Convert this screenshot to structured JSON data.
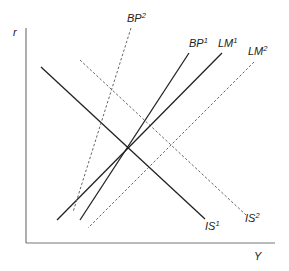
{
  "chart_data": {
    "type": "line",
    "title": "",
    "xlabel": "Y",
    "ylabel": "r",
    "grid": false,
    "lines": [
      {
        "name": "IS1",
        "label": "IS",
        "sup": "1",
        "style": "solid",
        "x1": 41,
        "y1": 67,
        "x2": 205,
        "y2": 219
      },
      {
        "name": "IS2",
        "label": "IS",
        "sup": "2",
        "style": "dashed",
        "x1": 80,
        "y1": 60,
        "x2": 246,
        "y2": 215
      },
      {
        "name": "LM1",
        "label": "LM",
        "sup": "1",
        "style": "solid",
        "x1": 222,
        "y1": 53,
        "x2": 57,
        "y2": 220
      },
      {
        "name": "LM2",
        "label": "LM",
        "sup": "2",
        "style": "dashed",
        "x1": 254,
        "y1": 62,
        "x2": 88,
        "y2": 228
      },
      {
        "name": "BP1",
        "label": "BP",
        "sup": "1",
        "style": "solid",
        "x1": 189,
        "y1": 53,
        "x2": 80,
        "y2": 220
      },
      {
        "name": "BP2",
        "label": "BP",
        "sup": "2",
        "style": "dashed",
        "x1": 131,
        "y1": 28,
        "x2": 73,
        "y2": 212
      }
    ],
    "labels": [
      {
        "text": "BP",
        "sup": "2",
        "x": 127,
        "y": 22
      },
      {
        "text": "BP",
        "sup": "1",
        "x": 189,
        "y": 47
      },
      {
        "text": "LM",
        "sup": "1",
        "x": 218,
        "y": 47
      },
      {
        "text": "LM",
        "sup": "2",
        "x": 248,
        "y": 55
      },
      {
        "text": "IS",
        "sup": "1",
        "x": 205,
        "y": 230
      },
      {
        "text": "IS",
        "sup": "2",
        "x": 245,
        "y": 222
      }
    ]
  },
  "axes": {
    "y_label": "r",
    "x_label": "Y"
  }
}
